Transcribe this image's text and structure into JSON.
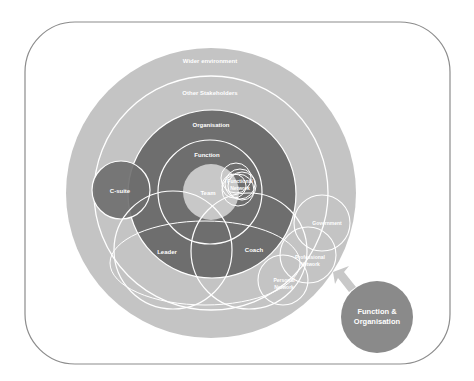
{
  "diagram": {
    "colors": {
      "frame": "#8c8c8c",
      "outer": "#c4c4c4",
      "organisation": "#6e6e6e",
      "team": "#c8c8c8",
      "csuite": "#6e6e6e",
      "function_org": "#8a8a8a",
      "arrow": "#c8c8c8",
      "line": "#ffffff"
    },
    "labels": {
      "wider_environment": "Wider environment",
      "other_stakeholders": "Other Stakeholders",
      "organisation": "Organisation",
      "function": "Function",
      "team": "Team",
      "functional_network_1": "Functional",
      "functional_network_2": "Network",
      "c_suite": "C-suite",
      "leader": "Leader",
      "coach": "Coach",
      "government": "Government",
      "professional_network_1": "Professional",
      "professional_network_2": "Network",
      "personal_network_1": "Personal",
      "personal_network_2": "Network",
      "function_org_1": "Function &",
      "function_org_2": "Organisation"
    }
  }
}
